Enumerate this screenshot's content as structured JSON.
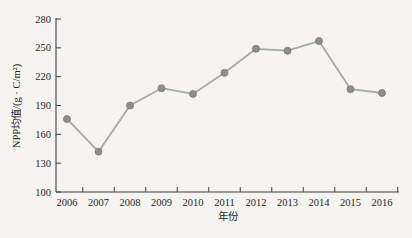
{
  "figure": {
    "background_color": "#f5f4f1",
    "axis_color": "#3f3f3f",
    "text_color": "#1f1f1f"
  },
  "chart_data": {
    "type": "line",
    "title": "",
    "xlabel": "年份",
    "ylabel": "NPP均值/(g · C/m²)",
    "x": [
      2006,
      2007,
      2008,
      2009,
      2010,
      2011,
      2012,
      2013,
      2014,
      2015,
      2016
    ],
    "series": [
      {
        "name": "NPP均值",
        "values": [
          176,
          142,
          190,
          208,
          202,
          224,
          249,
          247,
          257,
          207,
          203
        ]
      }
    ],
    "ylim": [
      100,
      280
    ],
    "yticks": [
      280,
      250,
      220,
      190,
      160,
      130,
      100
    ],
    "xlim": [
      2005.5,
      2016.6
    ],
    "grid": false,
    "legend": "none",
    "line_color": "#a8a8a8",
    "marker_color": "#8e8e8e",
    "marker_edge_color": "#7a7a7a",
    "marker_shape": "circle"
  }
}
